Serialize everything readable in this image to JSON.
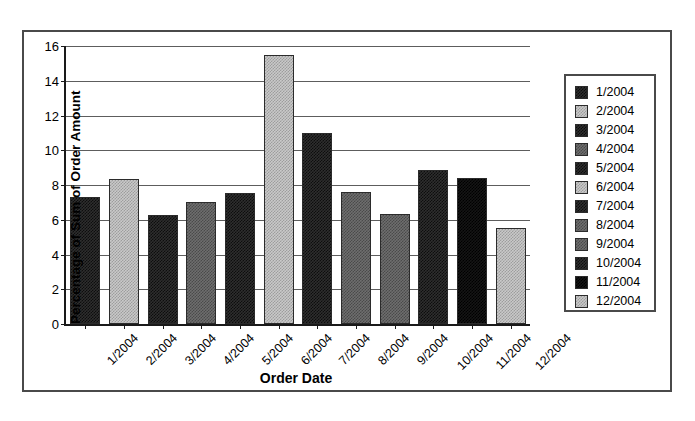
{
  "chart_data": {
    "type": "bar",
    "title": "",
    "xlabel": "Order Date",
    "ylabel": "Percentage of Sum of Order Amount",
    "categories": [
      "1/2004",
      "2/2004",
      "3/2004",
      "4/2004",
      "5/2004",
      "6/2004",
      "7/2004",
      "8/2004",
      "9/2004",
      "10/2004",
      "11/2004",
      "12/2004"
    ],
    "values": [
      7.3,
      8.35,
      6.25,
      7.05,
      7.55,
      15.5,
      11.0,
      7.6,
      6.35,
      8.85,
      8.4,
      5.5
    ],
    "ylim": [
      0,
      16
    ],
    "ytick_labels": [
      "0",
      "2",
      "4",
      "6",
      "8",
      "10",
      "12",
      "14",
      "16"
    ],
    "ytick_values": [
      0,
      2,
      4,
      6,
      8,
      10,
      12,
      14,
      16
    ],
    "grid": true,
    "legend_position": "right",
    "bar_styles": [
      "dark",
      "light",
      "dark",
      "mid",
      "dark",
      "light",
      "dark",
      "mid",
      "mid",
      "dark",
      "black",
      "light"
    ],
    "colors": {
      "dark": "#2e2e2e",
      "mid": "#6e6e6e",
      "light": "#c9c9c9",
      "black": "#151515",
      "axis": "#1a1a1a",
      "grid": "#5d5d5d",
      "border": "#4a4a4a",
      "background": "#ffffff"
    }
  },
  "legend": {
    "items": [
      {
        "label": "1/2004",
        "style": "dark"
      },
      {
        "label": "2/2004",
        "style": "light"
      },
      {
        "label": "3/2004",
        "style": "dark"
      },
      {
        "label": "4/2004",
        "style": "mid"
      },
      {
        "label": "5/2004",
        "style": "dark"
      },
      {
        "label": "6/2004",
        "style": "light"
      },
      {
        "label": "7/2004",
        "style": "dark"
      },
      {
        "label": "8/2004",
        "style": "mid"
      },
      {
        "label": "9/2004",
        "style": "mid"
      },
      {
        "label": "10/2004",
        "style": "dark"
      },
      {
        "label": "11/2004",
        "style": "black"
      },
      {
        "label": "12/2004",
        "style": "light"
      }
    ]
  }
}
